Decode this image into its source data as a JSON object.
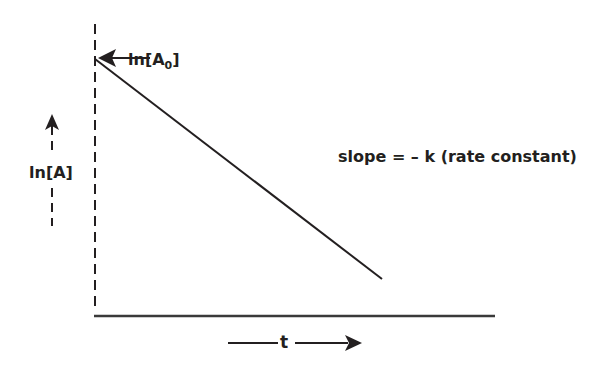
{
  "diagram": {
    "type": "first-order kinetics plot",
    "y_axis_label": "ln[A]",
    "x_axis_label": "t",
    "intercept_label": {
      "prefix": "ln[A",
      "subscript": "0",
      "suffix": "]"
    },
    "slope_annotation": "slope = – k (rate constant)",
    "line_color": "#231f20",
    "line": {
      "start": [
        95,
        59
      ],
      "end": [
        382,
        279
      ]
    }
  }
}
